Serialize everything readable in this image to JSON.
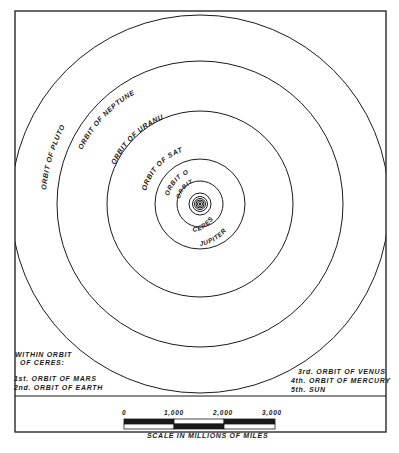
{
  "diagram": {
    "orbit_labels": {
      "pluto": "ORBIT OF PLUTO",
      "neptune": "ORBIT OF NEPTUNE",
      "uranus": "ORBIT OF URANUS",
      "saturn": "ORBIT OF SATURN",
      "jupiter_top": "ORBIT OF",
      "jupiter_bottom": "JUPITER",
      "ceres_top": "ORBIT OF",
      "ceres_bottom": "CERES"
    },
    "inner_note": {
      "heading_line1": "WITHIN ORBIT",
      "heading_line2": "OF CERES:",
      "items": [
        "1st. ORBIT OF MARS",
        "2nd. ORBIT OF EARTH",
        "3rd. ORBIT OF VENUS",
        "4th. ORBIT OF MERCURY",
        "5th. SUN"
      ]
    },
    "scale": {
      "ticks": [
        "0",
        "1,000",
        "2,000",
        "3,000"
      ],
      "caption": "SCALE IN MILLIONS OF MILES"
    },
    "colors": {
      "ink": "#1a1a1a",
      "paper": "#ffffff"
    }
  }
}
